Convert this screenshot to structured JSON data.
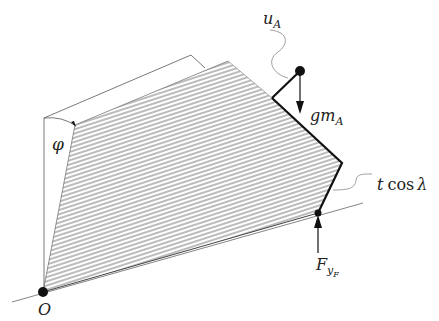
{
  "diagram": {
    "type": "free-body mechanics sketch",
    "colors": {
      "stroke": "#111111",
      "thin_stroke": "#555555",
      "hatch": "#777777",
      "background": "#ffffff"
    },
    "labels": {
      "origin": "O",
      "angle": "φ",
      "point_a_sub": "A",
      "point_a_base": "u",
      "gravity_base": "gm",
      "gravity_sub": "A",
      "length_t": "t",
      "length_cos": "cos",
      "length_lambda": "λ",
      "force_base": "F",
      "force_sub": "y",
      "force_subsub": "F"
    },
    "points": {
      "O": [
        43,
        292
      ],
      "hatch_top_left": [
        75,
        125
      ],
      "hatch_top": [
        228,
        61
      ],
      "joint_upper": [
        272,
        98
      ],
      "joint_right": [
        342,
        163
      ],
      "F": [
        318,
        213
      ],
      "A": [
        300,
        71
      ]
    }
  }
}
